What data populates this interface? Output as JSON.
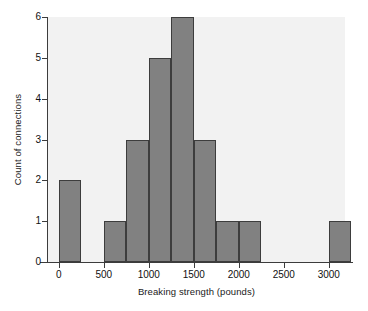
{
  "chart_data": {
    "type": "bar",
    "title": "",
    "subtitle": "",
    "xlabel": "Breaking strength (pounds)",
    "ylabel": "Count of connections",
    "grid": false,
    "legend": null,
    "xlim": [
      -120,
      3180
    ],
    "ylim": [
      0,
      6
    ],
    "bin_width": 250,
    "x_ticks": [
      0,
      500,
      1000,
      1500,
      2000,
      2500,
      3000
    ],
    "x_tick_labels": [
      "0",
      "500",
      "1000",
      "1500",
      "2000",
      "2500",
      "3000"
    ],
    "y_ticks": [
      0,
      1,
      2,
      3,
      4,
      5,
      6
    ],
    "y_tick_labels": [
      "0",
      "1",
      "2",
      "3",
      "4",
      "5",
      "6"
    ],
    "bins": [
      {
        "start": 0,
        "end": 250,
        "count": 2
      },
      {
        "start": 250,
        "end": 500,
        "count": 0
      },
      {
        "start": 500,
        "end": 750,
        "count": 1
      },
      {
        "start": 750,
        "end": 1000,
        "count": 3
      },
      {
        "start": 1000,
        "end": 1250,
        "count": 5
      },
      {
        "start": 1250,
        "end": 1500,
        "count": 6
      },
      {
        "start": 1500,
        "end": 1750,
        "count": 3
      },
      {
        "start": 1750,
        "end": 2000,
        "count": 1
      },
      {
        "start": 2000,
        "end": 2250,
        "count": 1
      },
      {
        "start": 2250,
        "end": 2500,
        "count": 0
      },
      {
        "start": 2500,
        "end": 2750,
        "count": 0
      },
      {
        "start": 2750,
        "end": 3000,
        "count": 0
      },
      {
        "start": 3000,
        "end": 3250,
        "count": 1
      }
    ],
    "categories": [
      "0-250",
      "250-500",
      "500-750",
      "750-1000",
      "1000-1250",
      "1250-1500",
      "1500-1750",
      "1750-2000",
      "2000-2250",
      "2250-2500",
      "2500-2750",
      "2750-3000",
      "3000-3250"
    ],
    "values": [
      2,
      0,
      1,
      3,
      5,
      6,
      3,
      1,
      1,
      0,
      0,
      0,
      1
    ]
  },
  "style": {
    "bar_fill": "#818181",
    "bar_edge": "#3d3d3d",
    "plot_background": "#f2f2f2",
    "axis_color": "#3c3c3c",
    "text_color": "#111111",
    "page_background": "#ffffff"
  }
}
